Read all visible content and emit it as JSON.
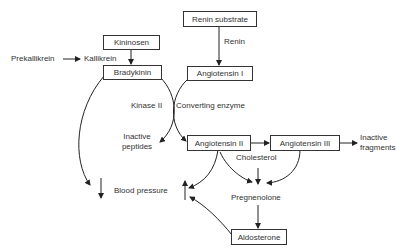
{
  "diagram": {
    "type": "biochemical pathway",
    "nodes": {
      "renin_substrate": "Renin substrate",
      "angiotensin_1": "Angiotensin I",
      "angiotensin_2": "Angiotensin II",
      "angiotensin_3": "Angiotensin III",
      "kininosen": "Kininosen",
      "bradykinin": "Bradykinin",
      "aldosterone": "Aldosterone"
    },
    "labels": {
      "renin": "Renin",
      "prekallikrein": "Prekallikrein",
      "kallikrein": "Kallikrein",
      "kinase_2": "Kinase II",
      "converting_enzyme": "Converting enzyme",
      "inactive_peptides_1": "Inactive",
      "inactive_peptides_2": "peptides",
      "inactive_fragments_1": "Inactive",
      "inactive_fragments_2": "fragments",
      "cholesterol": "Cholesterol",
      "pregnenolone": "Pregnenolone",
      "blood_pressure": "Blood pressure"
    },
    "edges": [
      {
        "from": "Renin substrate",
        "to": "Angiotensin I",
        "label": "Renin"
      },
      {
        "from": "Prekallikrein",
        "to": "Kallikrein"
      },
      {
        "from": "Kininosen",
        "to": "Bradykinin"
      },
      {
        "from": "Bradykinin",
        "to": "Inactive peptides",
        "label": "Kinase II"
      },
      {
        "from": "Angiotensin I",
        "to": "Angiotensin II",
        "label": "Converting enzyme"
      },
      {
        "from": "Bradykinin",
        "to": "Blood pressure (decrease)"
      },
      {
        "from": "Angiotensin II",
        "to": "Angiotensin III"
      },
      {
        "from": "Angiotensin III",
        "to": "Inactive fragments"
      },
      {
        "from": "Angiotensin II",
        "to": "Blood pressure (increase)"
      },
      {
        "from": "Angiotensin II",
        "to": "Pregnenolone"
      },
      {
        "from": "Angiotensin III",
        "to": "Pregnenolone"
      },
      {
        "from": "Cholesterol",
        "to": "Pregnenolone"
      },
      {
        "from": "Pregnenolone",
        "to": "Aldosterone"
      },
      {
        "from": "Aldosterone",
        "to": "Blood pressure (increase)"
      }
    ]
  }
}
